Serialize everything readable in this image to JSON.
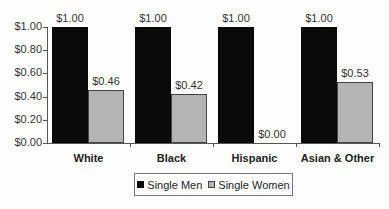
{
  "chart_data": {
    "type": "bar",
    "title": "",
    "xlabel": "",
    "ylabel": "",
    "categories": [
      "White",
      "Black",
      "Hispanic",
      "Asian & Other"
    ],
    "series": [
      {
        "name": "Single Men",
        "values": [
          1.0,
          1.0,
          1.0,
          1.0
        ],
        "labels": [
          "$1.00",
          "$1.00",
          "$1.00",
          "$1.00"
        ],
        "color": "#0a0a0a"
      },
      {
        "name": "Single Women",
        "values": [
          0.46,
          0.42,
          0.0,
          0.53
        ],
        "labels": [
          "$0.46",
          "$0.42",
          "$0.00",
          "$0.53"
        ],
        "color": "#b4b4b4"
      }
    ],
    "ylim": [
      0,
      1.0
    ],
    "yticks": [
      "$0.00",
      "$0.20",
      "$0.40",
      "$0.60",
      "$0.80",
      "$1.00"
    ],
    "grid": false,
    "legend_position": "bottom"
  },
  "legend": {
    "items": [
      "Single Men",
      "Single Women"
    ]
  }
}
